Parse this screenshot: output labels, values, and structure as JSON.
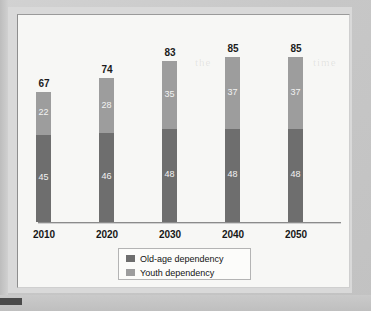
{
  "chart_data": {
    "type": "bar",
    "stacked": true,
    "title": "",
    "xlabel": "",
    "ylabel": "",
    "categories": [
      "2010",
      "2020",
      "2030",
      "2040",
      "2050"
    ],
    "series": [
      {
        "name": "Old-age dependency",
        "values": [
          45,
          46,
          48,
          48,
          48
        ],
        "color": "#6e6e6e"
      },
      {
        "name": "Youth dependency",
        "values": [
          22,
          28,
          35,
          37,
          37
        ],
        "color": "#9d9d9d"
      }
    ],
    "totals": [
      67,
      74,
      83,
      85,
      85
    ],
    "ylim": [
      0,
      90
    ],
    "grid": false,
    "legend_position": "bottom-center"
  },
  "legend": {
    "items": [
      {
        "label": "Old-age dependency",
        "color": "#6e6e6e"
      },
      {
        "label": "Youth dependency",
        "color": "#9d9d9d"
      }
    ]
  },
  "ghost_text": {
    "a": "the",
    "b": "time"
  }
}
